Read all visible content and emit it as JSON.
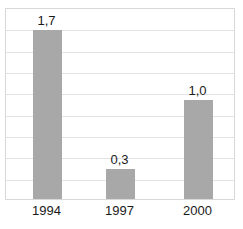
{
  "chart_data": {
    "type": "bar",
    "title": "",
    "subtitle": "",
    "xlabel": "",
    "ylabel": "",
    "categories": [
      "1994",
      "1997",
      "2000"
    ],
    "values": [
      1.7,
      0.3,
      1.0
    ],
    "value_labels": [
      "1,7",
      "0,3",
      "1,0"
    ],
    "decimal_separator": ",",
    "ylim": [
      0,
      1.93
    ],
    "grid": true,
    "gridline_count": 8,
    "legend": null,
    "legend_position": "none",
    "series": [
      {
        "name": "",
        "values": [
          1.7,
          0.3,
          1.0
        ]
      }
    ],
    "colors": {
      "bar": "#a8a8a8",
      "gridline": "#e3e3e3",
      "plot_border": "#d8d8d8",
      "plot_background": "#ffffff",
      "text": "#1a1a1a"
    }
  }
}
